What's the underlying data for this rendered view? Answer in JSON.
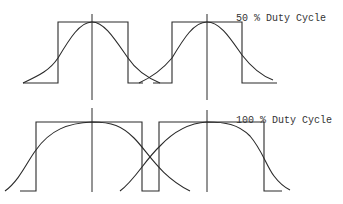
{
  "diagram": {
    "panels": [
      {
        "id": "top",
        "label": "50 % Duty Cycle",
        "label_pos": [
          236,
          14
        ],
        "pulse_path": "M23,83 L58,83 L58,22 L128,22 L128,83 L143,83 M153,83 L172,83 L172,22 L242,22 L242,83 L277,83",
        "curves": [
          "M23,83 C40,75 50,70 58,58 C70,38 80,22 92,22 C104,22 114,38 128,58 C136,70 148,78 160,83",
          "M139,83 C150,78 162,70 172,58 C184,38 194,22 207,22 C220,22 230,38 242,55 C252,68 262,76 273,80"
        ],
        "centerlines": [
          {
            "x": 92,
            "y1": 14,
            "y2": 100
          },
          {
            "x": 207,
            "y1": 14,
            "y2": 100
          }
        ]
      },
      {
        "id": "bottom",
        "label": "100 % Duty Cycle",
        "label_pos": [
          236,
          116
        ],
        "pulse_path": "M20,191 L36,191 L36,122 L142,122 L142,191 L159,191 L159,122 L264,122 L264,191 L282,191",
        "curves": [
          "M5,191 C20,180 28,160 36,150 C50,130 68,123 92,122 C112,122 122,126 134,138 C148,152 160,176 190,191",
          "M120,191 C135,180 145,160 160,146 C175,130 190,123 207,122 C225,122 238,124 250,136 C262,150 266,165 274,176 C280,184 286,188 290,190"
        ],
        "centerlines": [
          {
            "x": 92,
            "y1": 108,
            "y2": 192
          },
          {
            "x": 207,
            "y1": 110,
            "y2": 192
          }
        ]
      }
    ],
    "colors": {
      "stroke": "#2a2a2a",
      "text": "#333333",
      "background": "#ffffff"
    }
  }
}
